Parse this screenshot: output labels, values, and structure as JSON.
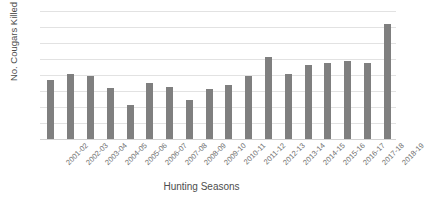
{
  "chart_data": {
    "type": "bar",
    "title": "",
    "xlabel": "Hunting Seasons",
    "ylabel": "No. Cougars Killed",
    "ylim": [
      0,
      400
    ],
    "yticks": [
      0,
      50,
      100,
      150,
      200,
      250,
      300,
      350,
      400
    ],
    "ytick_labels": [
      "0",
      "50",
      "100",
      "150",
      "200",
      "250",
      "300",
      "350",
      "400"
    ],
    "grid": "horizontal",
    "legend": "none",
    "bar_color": "#7f7f7f",
    "categories": [
      "2001-02",
      "2002-03",
      "2003-04",
      "2004-05",
      "2005-06",
      "2006-07",
      "2007-08",
      "2008-09",
      "2009-10",
      "2010-11",
      "2011-12",
      "2012-13",
      "2013-14",
      "2014-15",
      "2015-16",
      "2016-17",
      "2017-18",
      "2018-19"
    ],
    "values": [
      185,
      202,
      197,
      160,
      106,
      176,
      163,
      122,
      157,
      168,
      198,
      257,
      203,
      232,
      238,
      244,
      238,
      358
    ]
  },
  "figure": {
    "title_clipped": "",
    "axis_label_color": "#4d4d4d",
    "tick_label_color": "#707070",
    "gridline_color": "#e2e2e2",
    "background": "#ffffff"
  }
}
